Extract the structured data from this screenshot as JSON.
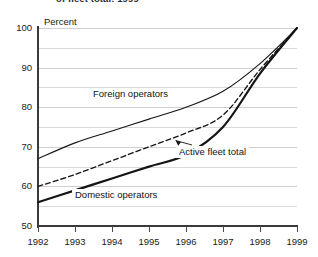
{
  "figure": {
    "clipped_title": "of fleet total: 1999",
    "axis_title": "Percent"
  },
  "chart_data": {
    "type": "line",
    "title": "",
    "xlabel": "",
    "ylabel": "Percent",
    "x": [
      1992,
      1993,
      1994,
      1995,
      1996,
      1997,
      1998,
      1999
    ],
    "xticklabels": [
      "1992",
      "1993",
      "1994",
      "1995",
      "1996",
      "1997",
      "1998",
      "1999"
    ],
    "yticklabels": [
      "50",
      "60",
      "70",
      "80",
      "90",
      "100"
    ],
    "ytickvalues": [
      50,
      60,
      70,
      80,
      90,
      100
    ],
    "ylim": [
      50,
      100
    ],
    "xlim": [
      1992,
      1999
    ],
    "grid": true,
    "gridline_interval": 5,
    "legend": "inline-labels",
    "series": [
      {
        "name": "Foreign operators",
        "style": "solid-thin",
        "values": [
          67,
          71,
          74,
          77,
          80,
          84,
          91,
          100
        ]
      },
      {
        "name": "Active fleet total",
        "style": "dashed",
        "values": [
          60,
          63,
          66.5,
          70,
          73.5,
          78,
          89.5,
          100
        ]
      },
      {
        "name": "Domestic operators",
        "style": "solid-thick",
        "values": [
          56,
          59,
          62,
          65,
          68,
          75,
          88.5,
          100
        ]
      }
    ],
    "annotations": [
      {
        "text": "Foreign operators",
        "target_series": "Foreign operators"
      },
      {
        "text": "Active fleet total",
        "target_series": "Active fleet total",
        "leader_line": true
      },
      {
        "text": "Domestic operators",
        "target_series": "Domestic operators"
      }
    ]
  },
  "colors": {
    "line": "#151515",
    "axis": "#3a3a3a",
    "grid": "#d9d9d9",
    "background": "#ffffff"
  }
}
